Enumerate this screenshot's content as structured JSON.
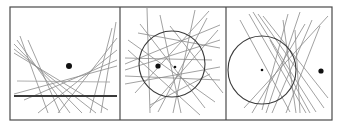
{
  "figure": {
    "colors": {
      "frame": "#4a4a4a",
      "lines": "#8a8a8a",
      "circle": "#3a3a3a",
      "focus": "#111111",
      "background": "#ffffff"
    },
    "frame": {
      "x": 10,
      "y": 7,
      "width": 322,
      "height": 113
    },
    "dividers": [
      120,
      226
    ],
    "panels": [
      {
        "name": "parabola",
        "focus": {
          "cx": 69,
          "cy": 66,
          "r": 3
        },
        "directrix": {
          "x1": 14,
          "y1": 96,
          "x2": 117,
          "y2": 96
        },
        "guide": {
          "x1": 17,
          "y1": 81,
          "x2": 110,
          "y2": 82
        },
        "lines": [
          [
            14,
            44,
            82,
            113
          ],
          [
            14,
            49,
            96,
            113
          ],
          [
            17,
            40,
            70,
            113
          ],
          [
            20,
            36,
            48,
            113
          ],
          [
            14,
            53,
            108,
            110
          ],
          [
            112,
            28,
            90,
            113
          ],
          [
            117,
            38,
            58,
            113
          ],
          [
            117,
            50,
            38,
            113
          ],
          [
            117,
            60,
            24,
            100
          ],
          [
            117,
            66,
            14,
            94
          ],
          [
            116,
            22,
            101,
            113
          ],
          [
            28,
            40,
            60,
            113
          ]
        ]
      },
      {
        "name": "ellipse",
        "circle": {
          "cx": 172,
          "cy": 64,
          "r": 33
        },
        "foci": [
          {
            "cx": 158,
            "cy": 66,
            "r": 2.6
          },
          {
            "cx": 175,
            "cy": 67,
            "r": 1.3
          }
        ],
        "lines": [
          [
            147,
            8,
            150,
            113
          ],
          [
            125,
            64,
            220,
            25
          ],
          [
            125,
            70,
            220,
            40
          ],
          [
            128,
            50,
            200,
            115
          ],
          [
            140,
            24,
            205,
            108
          ],
          [
            160,
            15,
            181,
            113
          ],
          [
            125,
            58,
            212,
            60
          ],
          [
            135,
            93,
            209,
            11
          ],
          [
            150,
            108,
            218,
            30
          ],
          [
            195,
            10,
            173,
            113
          ],
          [
            207,
            18,
            158,
            112
          ],
          [
            125,
            84,
            220,
            67
          ],
          [
            128,
            40,
            215,
            102
          ],
          [
            125,
            76,
            220,
            80
          ],
          [
            170,
            26,
            223,
            93
          ],
          [
            138,
            33,
            220,
            48
          ],
          [
            210,
            74,
            150,
            105
          ]
        ]
      },
      {
        "name": "hyperbola",
        "circle": {
          "cx": 262,
          "cy": 70,
          "r": 34
        },
        "foci": [
          {
            "cx": 262,
            "cy": 70,
            "r": 1.3
          },
          {
            "cx": 321,
            "cy": 71,
            "r": 2.6
          }
        ],
        "lines": [
          [
            249,
            14,
            306,
            113
          ],
          [
            253,
            12,
            316,
            112
          ],
          [
            258,
            14,
            324,
            108
          ],
          [
            263,
            16,
            328,
            98
          ],
          [
            240,
            20,
            290,
            112
          ],
          [
            288,
            14,
            262,
            110
          ],
          [
            300,
            12,
            266,
            113
          ],
          [
            312,
            20,
            272,
            113
          ],
          [
            320,
            26,
            286,
            113
          ],
          [
            283,
            20,
            296,
            113
          ],
          [
            305,
            24,
            252,
            113
          ],
          [
            328,
            16,
            244,
            108
          ],
          [
            270,
            40,
            310,
            113
          ],
          [
            295,
            30,
            300,
            113
          ]
        ]
      }
    ]
  }
}
